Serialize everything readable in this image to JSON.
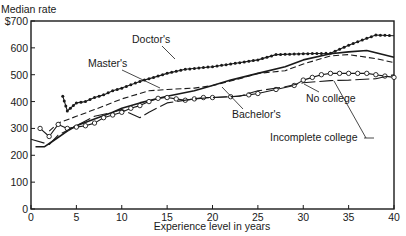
{
  "chart_data": {
    "type": "line",
    "title": "",
    "ylabel": "Median rate",
    "xlabel": "Experience level in years",
    "xlim": [
      0,
      40
    ],
    "ylim": [
      0,
      700
    ],
    "x_ticks": [
      0,
      5,
      10,
      15,
      20,
      25,
      30,
      35,
      40
    ],
    "y_ticks": [
      0,
      100,
      200,
      300,
      400,
      500,
      600,
      700
    ],
    "y_tick_labels": [
      "0",
      "100",
      "200",
      "300",
      "400",
      "500",
      "600",
      "$700"
    ],
    "grid": false,
    "legend": "inline labels with arrows",
    "series": [
      {
        "name": "Doctor's",
        "style": "dotted-filled-markers",
        "x": [
          3.5,
          4,
          5,
          6,
          7,
          8,
          9,
          10,
          12,
          14,
          15,
          17,
          20,
          22,
          25,
          27,
          30,
          33,
          35,
          38,
          40
        ],
        "y": [
          420,
          365,
          395,
          400,
          415,
          425,
          440,
          450,
          475,
          495,
          505,
          520,
          530,
          540,
          555,
          575,
          578,
          580,
          610,
          648,
          645
        ]
      },
      {
        "name": "Master's",
        "style": "dashed",
        "x": [
          2,
          3,
          5,
          7,
          10,
          13,
          15,
          18,
          20,
          23,
          25,
          28,
          30,
          33,
          35,
          38,
          40
        ],
        "y": [
          290,
          320,
          345,
          370,
          410,
          440,
          445,
          450,
          460,
          485,
          505,
          515,
          540,
          570,
          575,
          560,
          545
        ]
      },
      {
        "name": "Bachelor's",
        "style": "solid",
        "x": [
          0.5,
          1.5,
          2.5,
          4,
          5,
          7,
          9,
          10,
          12,
          15,
          18,
          20,
          22,
          25,
          28,
          30,
          33,
          35,
          37,
          40
        ],
        "y": [
          232,
          232,
          255,
          290,
          310,
          335,
          360,
          375,
          395,
          420,
          440,
          460,
          480,
          505,
          530,
          555,
          578,
          585,
          590,
          565
        ]
      },
      {
        "name": "No college",
        "style": "solid-open-circles",
        "x": [
          1,
          2,
          3,
          4,
          5,
          6,
          7,
          8,
          9,
          10,
          11,
          12,
          13,
          14,
          15,
          16,
          17,
          18,
          19,
          20,
          22,
          24,
          25,
          27,
          29,
          30,
          31,
          32,
          33,
          34,
          35,
          36,
          37,
          38,
          39,
          40
        ],
        "y": [
          300,
          270,
          315,
          300,
          305,
          310,
          320,
          340,
          350,
          360,
          375,
          385,
          400,
          412,
          415,
          410,
          405,
          410,
          415,
          415,
          418,
          425,
          430,
          445,
          460,
          480,
          490,
          500,
          505,
          505,
          505,
          505,
          505,
          500,
          495,
          490
        ]
      },
      {
        "name": "Incomplete college",
        "style": "long-dash",
        "x": [
          0,
          2,
          3,
          5,
          7,
          9,
          10,
          12,
          13,
          15,
          18,
          20,
          23,
          25,
          28,
          30,
          33,
          35,
          38,
          40
        ],
        "y": [
          260,
          240,
          275,
          310,
          345,
          360,
          370,
          340,
          360,
          395,
          410,
          415,
          420,
          440,
          455,
          470,
          478,
          480,
          485,
          500
        ]
      }
    ],
    "annotations": [
      {
        "text": "Doctor's",
        "label_xy": [
          27,
          95
        ],
        "arrow_to": [
          30,
          120
        ]
      },
      {
        "text": "Master's",
        "label_xy": [
          14,
          60
        ],
        "arrow_to": [
          18,
          88
        ]
      },
      {
        "text": "Bachelor's",
        "label_xy": [
          32,
          118
        ],
        "arrow_to": [
          26,
          100
        ]
      },
      {
        "text": "No college",
        "label_xy": [
          42,
          101
        ],
        "arrow_to": [
          36,
          91
        ]
      },
      {
        "text": "Incomplete college",
        "label_xy": [
          53,
          156
        ],
        "arrow_to": [
          58,
          116
        ]
      }
    ]
  },
  "axes": {
    "ylabel": "Median rate",
    "xlabel": "Experience level in years"
  },
  "labels": {
    "doctors": "Doctor's",
    "masters": "Master's",
    "bachelors": "Bachelor's",
    "no_college": "No college",
    "incomplete_college": "Incomplete college"
  },
  "colors": {
    "ink": "#1a1a1a",
    "background": "#ffffff"
  }
}
